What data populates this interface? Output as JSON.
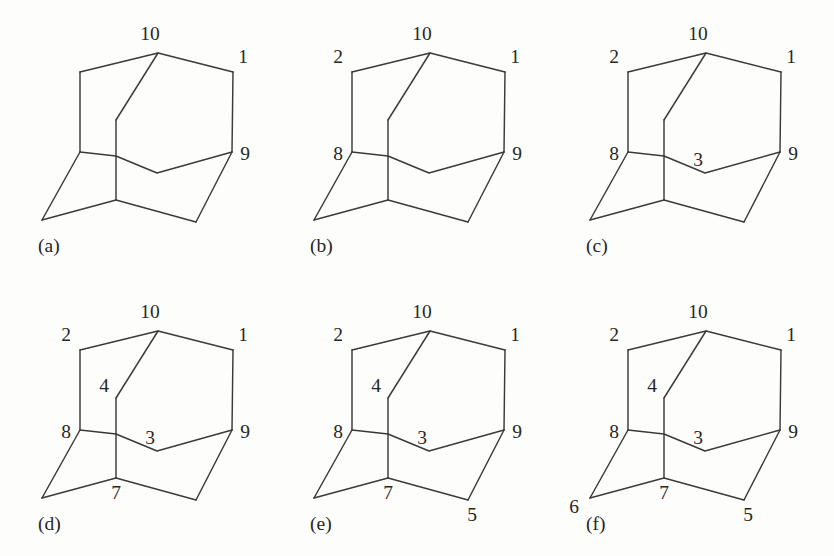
{
  "figure": {
    "type": "diagram",
    "background_color": "#fdfdfb",
    "line_color": "#3a3a3a",
    "text_color": "#262626",
    "panel_grid": {
      "columns": 3,
      "rows": 2
    }
  },
  "geometry": {
    "note": "Shared polyline skeleton for every panel, in 278x278 panel coordinates.",
    "vertices": {
      "v10_apex": [
        158,
        53
      ],
      "v2_upper_left": [
        80,
        72
      ],
      "v1_upper_right": [
        233,
        72
      ],
      "v8_mid_left": [
        80,
        152
      ],
      "v9_mid_right": [
        232,
        152
      ],
      "v4_inner_top": [
        116,
        120
      ],
      "v3_inner_front": [
        157,
        173
      ],
      "v_cross": [
        116,
        156
      ],
      "v7_bottom_mid": [
        116,
        200
      ],
      "v6_bottom_left": [
        42,
        220
      ],
      "v5_bottom_right": [
        196,
        222
      ]
    },
    "edges": [
      "v2 - v10 - v1  (upper roof)",
      "v2 - v8  (left vertical)",
      "v1 - v9  (right vertical)",
      "v10 - v4 (inner diagonal down-left)",
      "v4 - v_cross - v7 (inner vertical)",
      "v8 - v_cross - v3 - v9 (inner front belt)",
      "v8 - v6 (lower-left diagonal)",
      "v6 - v7 (lower-left floor)",
      "v7 - v5 (lower-right floor)",
      "v5 - v9 (lower-right diagonal)"
    ]
  },
  "panels": [
    {
      "id": "a",
      "caption": "(a)",
      "caption_pos": [
        38,
        252
      ],
      "labels": [
        {
          "text": "10",
          "name": "vertex-label-10",
          "x": 150,
          "y": 40
        },
        {
          "text": "1",
          "name": "vertex-label-1",
          "x": 243,
          "y": 63
        },
        {
          "text": "9",
          "name": "vertex-label-9",
          "x": 245,
          "y": 160
        }
      ]
    },
    {
      "id": "b",
      "caption": "(b)",
      "caption_pos": [
        38,
        252
      ],
      "labels": [
        {
          "text": "10",
          "name": "vertex-label-10",
          "x": 150,
          "y": 40
        },
        {
          "text": "2",
          "name": "vertex-label-2",
          "x": 66,
          "y": 63
        },
        {
          "text": "1",
          "name": "vertex-label-1",
          "x": 243,
          "y": 63
        },
        {
          "text": "8",
          "name": "vertex-label-8",
          "x": 66,
          "y": 160
        },
        {
          "text": "9",
          "name": "vertex-label-9",
          "x": 245,
          "y": 160
        }
      ]
    },
    {
      "id": "c",
      "caption": "(c)",
      "caption_pos": [
        38,
        252
      ],
      "labels": [
        {
          "text": "10",
          "name": "vertex-label-10",
          "x": 150,
          "y": 40
        },
        {
          "text": "2",
          "name": "vertex-label-2",
          "x": 66,
          "y": 63
        },
        {
          "text": "1",
          "name": "vertex-label-1",
          "x": 243,
          "y": 63
        },
        {
          "text": "8",
          "name": "vertex-label-8",
          "x": 66,
          "y": 160
        },
        {
          "text": "3",
          "name": "vertex-label-3",
          "x": 150,
          "y": 166
        },
        {
          "text": "9",
          "name": "vertex-label-9",
          "x": 245,
          "y": 160
        }
      ]
    },
    {
      "id": "d",
      "caption": "(d)",
      "caption_pos": [
        38,
        252
      ],
      "labels": [
        {
          "text": "10",
          "name": "vertex-label-10",
          "x": 150,
          "y": 40
        },
        {
          "text": "2",
          "name": "vertex-label-2",
          "x": 66,
          "y": 63
        },
        {
          "text": "1",
          "name": "vertex-label-1",
          "x": 243,
          "y": 63
        },
        {
          "text": "4",
          "name": "vertex-label-4",
          "x": 104,
          "y": 114
        },
        {
          "text": "8",
          "name": "vertex-label-8",
          "x": 66,
          "y": 160
        },
        {
          "text": "3",
          "name": "vertex-label-3",
          "x": 150,
          "y": 166
        },
        {
          "text": "9",
          "name": "vertex-label-9",
          "x": 245,
          "y": 160
        },
        {
          "text": "7",
          "name": "vertex-label-7",
          "x": 116,
          "y": 221
        }
      ]
    },
    {
      "id": "e",
      "caption": "(e)",
      "caption_pos": [
        38,
        252
      ],
      "labels": [
        {
          "text": "10",
          "name": "vertex-label-10",
          "x": 150,
          "y": 40
        },
        {
          "text": "2",
          "name": "vertex-label-2",
          "x": 66,
          "y": 63
        },
        {
          "text": "1",
          "name": "vertex-label-1",
          "x": 243,
          "y": 63
        },
        {
          "text": "4",
          "name": "vertex-label-4",
          "x": 104,
          "y": 114
        },
        {
          "text": "8",
          "name": "vertex-label-8",
          "x": 66,
          "y": 160
        },
        {
          "text": "3",
          "name": "vertex-label-3",
          "x": 150,
          "y": 166
        },
        {
          "text": "9",
          "name": "vertex-label-9",
          "x": 245,
          "y": 160
        },
        {
          "text": "7",
          "name": "vertex-label-7",
          "x": 116,
          "y": 221
        },
        {
          "text": "5",
          "name": "vertex-label-5",
          "x": 200,
          "y": 243
        }
      ]
    },
    {
      "id": "f",
      "caption": "(f)",
      "caption_pos": [
        38,
        252
      ],
      "labels": [
        {
          "text": "10",
          "name": "vertex-label-10",
          "x": 150,
          "y": 40
        },
        {
          "text": "2",
          "name": "vertex-label-2",
          "x": 66,
          "y": 63
        },
        {
          "text": "1",
          "name": "vertex-label-1",
          "x": 243,
          "y": 63
        },
        {
          "text": "4",
          "name": "vertex-label-4",
          "x": 104,
          "y": 114
        },
        {
          "text": "8",
          "name": "vertex-label-8",
          "x": 66,
          "y": 160
        },
        {
          "text": "3",
          "name": "vertex-label-3",
          "x": 150,
          "y": 166
        },
        {
          "text": "9",
          "name": "vertex-label-9",
          "x": 245,
          "y": 160
        },
        {
          "text": "7",
          "name": "vertex-label-7",
          "x": 116,
          "y": 221
        },
        {
          "text": "5",
          "name": "vertex-label-5",
          "x": 200,
          "y": 243
        },
        {
          "text": "6",
          "name": "vertex-label-6",
          "x": 26,
          "y": 235
        }
      ]
    }
  ],
  "panel_positions": [
    {
      "id": "a",
      "left": 0,
      "top": 0
    },
    {
      "id": "b",
      "left": 272,
      "top": 0
    },
    {
      "id": "c",
      "left": 548,
      "top": 0
    },
    {
      "id": "d",
      "left": 0,
      "top": 278
    },
    {
      "id": "e",
      "left": 272,
      "top": 278
    },
    {
      "id": "f",
      "left": 548,
      "top": 278
    }
  ]
}
